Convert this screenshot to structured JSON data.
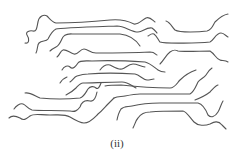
{
  "figure": {
    "caption": "(ii)",
    "stroke_color": "#555555",
    "background": "#ffffff",
    "chain_count": 14
  }
}
